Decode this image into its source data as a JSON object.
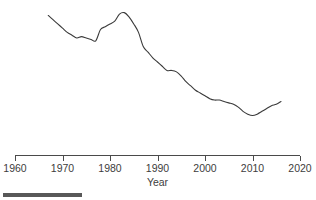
{
  "figure": {
    "background_color": "#ffffff",
    "line_color": "#3a3a3a",
    "axis_color": "#4a4a4a",
    "rule_color": "#585858"
  },
  "axis": {
    "x_title": "Year",
    "tick_labels": [
      "1960",
      "1970",
      "1980",
      "1990",
      "2000",
      "2010",
      "2020"
    ]
  },
  "footer": {
    "rule_name": "scale-rule"
  },
  "chart_data": {
    "type": "line",
    "title": "",
    "subtitle": "",
    "xlabel": "Year",
    "ylabel": "",
    "grid": false,
    "legend": false,
    "legend_position": "none",
    "xlim": [
      1960,
      2020
    ],
    "ylim": [
      0,
      100
    ],
    "xticks": [
      1960,
      1970,
      1980,
      1990,
      2000,
      2010,
      2020
    ],
    "yticks": [],
    "y_axis_visible": false,
    "series": [
      {
        "name": "series-1",
        "color": "#3a3a3a",
        "x": [
          1967,
          1968,
          1969,
          1970,
          1971,
          1972,
          1973,
          1974,
          1975,
          1976,
          1977,
          1978,
          1979,
          1980,
          1981,
          1982,
          1983,
          1984,
          1985,
          1986,
          1987,
          1988,
          1989,
          1990,
          1991,
          1992,
          1993,
          1994,
          1995,
          1996,
          1997,
          1998,
          1999,
          2000,
          2001,
          2002,
          2003,
          2004,
          2005,
          2006,
          2007,
          2008,
          2009,
          2010,
          2011,
          2012,
          2013,
          2014,
          2015,
          2016
        ],
        "values": [
          94,
          91,
          88,
          85,
          82,
          80,
          78,
          79,
          78,
          77,
          76,
          84,
          86,
          88,
          90,
          95,
          96,
          93,
          88,
          82,
          72,
          68,
          64,
          61,
          58,
          55,
          55,
          54,
          51,
          47,
          44,
          41,
          39,
          37,
          35,
          34,
          34,
          33,
          32,
          31,
          29,
          26,
          24,
          23,
          24,
          26,
          28,
          30,
          31,
          33
        ]
      }
    ]
  }
}
